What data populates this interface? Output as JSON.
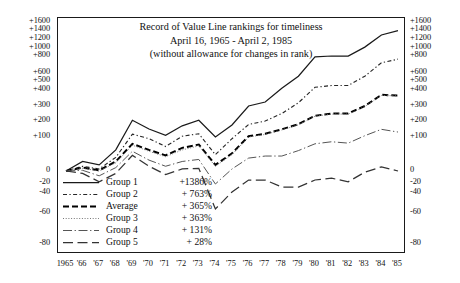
{
  "chart_data": {
    "type": "line",
    "title": "Record of Value Line rankings for timeliness",
    "subtitle": "April 16, 1965 - April 2, 1985",
    "note": "(without allowance for changes in rank)",
    "title_lines": [
      "Record of Value Line rankings for timeliness",
      "April 16, 1965 - April 2, 1985",
      "(without allowance for changes in rank)"
    ],
    "xlabel": "",
    "ylabel": "",
    "grid": false,
    "legend_position": "inside-lower-left",
    "x": [
      1965,
      1966,
      1967,
      1968,
      1969,
      1970,
      1971,
      1972,
      1973,
      1974,
      1975,
      1976,
      1977,
      1978,
      1979,
      1980,
      1981,
      1982,
      1983,
      1984,
      1985
    ],
    "xtick_labels": [
      "1965",
      "'66",
      "'67",
      "'68",
      "'69",
      "'70",
      "'71",
      "'72",
      "'73",
      "'74",
      "'75",
      "'76",
      "'77",
      "'78",
      "'79",
      "'80",
      "'81",
      "'82",
      "'83",
      "'84",
      "'85"
    ],
    "ytick_labels_left": [
      "+1600",
      "+1400",
      "+1200",
      "+1000",
      "+800",
      "+600",
      "+500",
      "+400",
      "+300",
      "+200",
      "+100",
      "0",
      "-20",
      "-40",
      "-60",
      "-80"
    ],
    "ytick_labels_right": [
      "+1600",
      "+1400",
      "+1200",
      "+1000",
      "+800",
      "+600",
      "+500",
      "+400",
      "+300",
      "+200",
      "+100",
      "0",
      "-20",
      "-40",
      "-60",
      "-80"
    ],
    "ytick_values": [
      1600,
      1400,
      1200,
      1000,
      800,
      600,
      500,
      400,
      300,
      200,
      100,
      0,
      -20,
      -40,
      -60,
      -80
    ],
    "ylim": [
      -85,
      1700
    ],
    "yscale": "log-of-one-plus-return",
    "units": "percent cumulative gain",
    "series": [
      {
        "name": "Group 1",
        "final_label": "+1386%",
        "style": "solid",
        "color": "#1a1a1a",
        "values": [
          0,
          28,
          18,
          62,
          205,
          150,
          110,
          170,
          205,
          100,
          175,
          300,
          325,
          420,
          560,
          790,
          800,
          800,
          1020,
          1290,
          1386
        ]
      },
      {
        "name": "Group 2",
        "final_label": "+ 763%",
        "style": "dotted-dashed",
        "color": "#262626",
        "values": [
          0,
          14,
          6,
          40,
          118,
          95,
          72,
          105,
          120,
          48,
          95,
          178,
          200,
          250,
          320,
          430,
          450,
          450,
          560,
          720,
          763
        ]
      },
      {
        "name": "Average",
        "final_label": "+ 365%",
        "style": "dashed-bold",
        "color": "#000000",
        "values": [
          0,
          10,
          2,
          28,
          80,
          62,
          46,
          68,
          78,
          18,
          52,
          105,
          120,
          148,
          180,
          235,
          250,
          250,
          300,
          370,
          365
        ]
      },
      {
        "name": "Group 3",
        "final_label": "+ 363%",
        "style": "fine-dotted",
        "color": "#777777",
        "values": [
          0,
          8,
          0,
          24,
          76,
          58,
          42,
          62,
          74,
          14,
          48,
          100,
          116,
          144,
          176,
          232,
          246,
          246,
          296,
          366,
          363
        ]
      },
      {
        "name": "Group 4",
        "final_label": "+ 131%",
        "style": "dash-dot",
        "color": "#555555",
        "values": [
          0,
          2,
          -8,
          10,
          58,
          32,
          14,
          28,
          34,
          -22,
          6,
          38,
          44,
          44,
          60,
          80,
          86,
          82,
          108,
          148,
          131
        ]
      },
      {
        "name": "Group 5",
        "final_label": "+  28%",
        "style": "long-dashed",
        "color": "#333333",
        "values": [
          0,
          -4,
          -18,
          -4,
          46,
          14,
          -6,
          6,
          8,
          -56,
          -38,
          -15,
          -15,
          -28,
          -28,
          -15,
          -12,
          -18,
          -2,
          12,
          0
        ]
      }
    ]
  },
  "legend": {
    "rows": [
      {
        "label": "Group 1",
        "value": "+1386%"
      },
      {
        "label": "Group 2",
        "value": "+ 763%"
      },
      {
        "label": "Average",
        "value": "+ 365%"
      },
      {
        "label": "Group 3",
        "value": "+ 363%"
      },
      {
        "label": "Group 4",
        "value": "+ 131%"
      },
      {
        "label": "Group 5",
        "value": "+  28%"
      }
    ]
  }
}
